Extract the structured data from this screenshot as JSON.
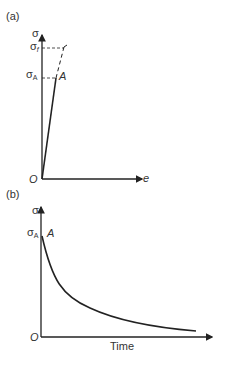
{
  "panel_a": {
    "label": "(a)",
    "y_axis_label": "σ",
    "x_axis_label": "e",
    "origin_label": "O",
    "point_label": "A",
    "sigma_f": {
      "main": "σ",
      "sub": "f"
    },
    "sigma_A": {
      "main": "σ",
      "sub": "A"
    }
  },
  "panel_b": {
    "label": "(b)",
    "y_axis_label": "σ",
    "x_axis_label": "Time",
    "origin_label": "O",
    "point_label": "A",
    "sigma_A": {
      "main": "σ",
      "sub": "A"
    }
  },
  "colors": {
    "line": "#222222",
    "text": "#333333"
  }
}
